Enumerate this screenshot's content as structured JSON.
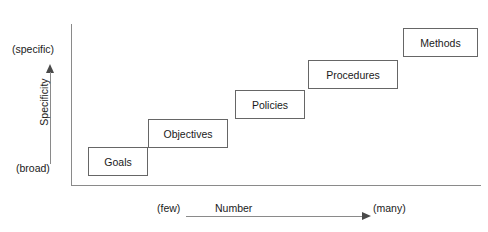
{
  "diagram": {
    "y_axis": {
      "label": "Specificity",
      "top_label": "(specific)",
      "bottom_label": "(broad)",
      "arrow_direction": "up"
    },
    "x_axis": {
      "label": "Number",
      "start_label": "(few)",
      "end_label": "(many)",
      "arrow_direction": "right"
    },
    "steps": [
      {
        "label": "Goals",
        "left": 88,
        "top": 147,
        "width": 60,
        "height": 29
      },
      {
        "label": "Objectives",
        "left": 148,
        "top": 119,
        "width": 80,
        "height": 29
      },
      {
        "label": "Policies",
        "left": 235,
        "top": 90,
        "width": 70,
        "height": 29
      },
      {
        "label": "Procedures",
        "left": 308,
        "top": 60,
        "width": 90,
        "height": 29
      },
      {
        "label": "Methods",
        "left": 403,
        "top": 28,
        "width": 75,
        "height": 29
      }
    ],
    "colors": {
      "axis": "#8a8a8a",
      "box_border": "#666666",
      "box_fill": "#ffffff",
      "text": "#1a1a1a",
      "background": "#ffffff"
    }
  }
}
